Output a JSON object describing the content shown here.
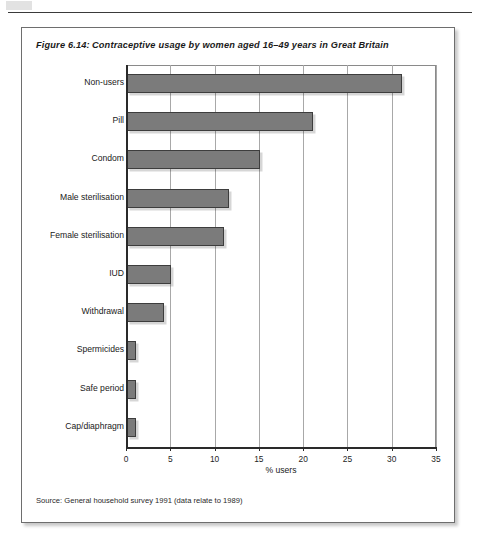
{
  "figure": {
    "number_label": "Figure 6.14:",
    "title": "Contraceptive usage by women aged 16–49 years in Great Britain",
    "source_note": "Source: General household survey 1991 (data relate to 1989)"
  },
  "chart_data": {
    "type": "bar",
    "orientation": "horizontal",
    "title": "Contraceptive usage by women aged 16–49 years in Great Britain",
    "xlabel": "% users",
    "ylabel": "",
    "xlim": [
      0,
      35
    ],
    "xticks": [
      0,
      5,
      10,
      15,
      20,
      25,
      30,
      35
    ],
    "xtick_labels": [
      "0",
      "5",
      "10",
      "15",
      "20",
      "25",
      "30",
      "35"
    ],
    "grid": "vertical",
    "legend": "none",
    "bar_color": "#7b7b7b",
    "bar_edge_color": "#3d3d3d",
    "categories": [
      "Non-users",
      "Pill",
      "Condom",
      "Male sterilisation",
      "Female sterilisation",
      "IUD",
      "Withdrawal",
      "Spermicides",
      "Safe period",
      "Cap/diaphragm"
    ],
    "values": [
      31,
      21,
      15,
      11.5,
      11,
      5,
      4.2,
      1,
      1,
      1
    ]
  }
}
